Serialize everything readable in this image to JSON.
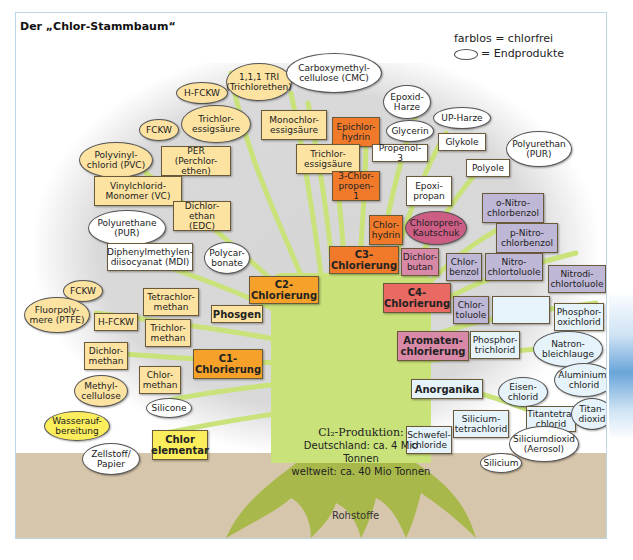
{
  "title": "Der „Chlor-Stammbaum“",
  "legend": {
    "chlorfree": "farblos = chlorfrei",
    "endproducts": "= Endprodukte"
  },
  "center": {
    "heading": "Cl₂-Produktion:",
    "germany": "Deutschland: ca. 4 Mio Tonnen",
    "world": "weltweit: ca. 40 Mio Tonnen"
  },
  "roots_label": "Rohstoffe",
  "caption": "",
  "colors": {
    "c1_c2": "#f6a22a",
    "c3": "#f07a2a",
    "c4": "#e86a63",
    "aromaten": "#d989a8",
    "anorganika": "#e6f3fb",
    "chlor_elementar": "#fbed5c",
    "chlorinated_products": "#fde3a2",
    "trunk": "#c9e27a",
    "ground": "#d6c6ab"
  },
  "nodes": {
    "hfckw_top": "H-FCKW",
    "tri": "1,1,1 TRI\n(Trichlorethen)",
    "cmc": "Carboxymethyl-\ncellulose (CMC)",
    "epoxidharze": "Epoxid-\nHarze",
    "fckw_top": "FCKW",
    "trichloressig_oval": "Trichlor-\nessigsäure",
    "monochloressig": "Monochlor-\nessigsäure",
    "epichlorhydrin": "Epichlor-\nhydrin",
    "glycerin": "Glycerin",
    "upharze": "UP-Harze",
    "pvc": "Polyvinyl-\nchlorid (PVC)",
    "per": "PER (Perchlor-\nethen)",
    "trichloressig_box": "Trichlor-\nessigsäure",
    "propenol": "Propenol-3",
    "glykole": "Glykole",
    "pur_right": "Polyurethan\n(PUR)",
    "polyole": "Polyole",
    "vc": "Vinylchlorid-\nMonomer (VC)",
    "chlorpropen": "3-Chlor-\npropen-1",
    "epoxipropan": "Epoxi-\npropan",
    "onitro": "o-Nitro-\nchlorbenzol",
    "edc": "Dichlor-\nethan (EDC)",
    "pur_left": "Polyurethane\n(PUR)",
    "chlorhydrin": "Chlor-\nhydrin",
    "chloropren": "Chloropren-\nKautschuk",
    "pnitro": "p-Nitro-\nchlorbenzol",
    "mdi": "Diphenylmethylen-\ndiisocyanat (MDI)",
    "polycarbonate": "Polycar-\nbonate",
    "c3": "C3-\nChlorierung",
    "dichlorbutan": "Dichlor-\nbutan",
    "chlorbenzol": "Chlor-\nbenzol",
    "nitrochlortoluole": "Nitro-\nchlortoluole",
    "nitrodichlortoluole": "Nitrodi-\nchlortoluole",
    "fckw_left": "FCKW",
    "c2": "C2-\nChlorierung",
    "c4": "C4-\nChlorierung",
    "tetrachlormethan": "Tetrachlor-\nmethan",
    "fluorpolymere": "Fluorpoly-\nmere (PTFE)",
    "chlortoluole": "Chlor-\ntoluole",
    "phosphorpenta": "Phosphor-\npentachlorid",
    "phosphoroxi": "Phosphor-\noxichlorid",
    "phosgen": "Phosgen",
    "hfckw_left": "H-FCKW",
    "trichlormethan": "Trichlor-\nmethan",
    "aromaten": "Aromaten-\nchlorierung",
    "phosphortri": "Phosphor-\ntrichlorid",
    "natronbleichlauge": "Natron-\nbleichlauge",
    "dichlormethan": "Dichlor-\nmethan",
    "c1": "C1-\nChlorierung",
    "aluminiumchlorid": "Aluminium-\nchlorid",
    "methylcellulose": "Methyl-\ncellulose",
    "chlormethan": "Chlor-\nmethan",
    "anorganika": "Anorganika",
    "eisenchlorid": "Eisen-\nchlorid",
    "titantetrachlorid": "Titantetra-\nchlorid",
    "titandioxid": "Titan-\ndioxid",
    "silicone": "Silicone",
    "siliciumtetrachlorid": "Silicium-\ntetrachlorid",
    "wasseraufbereitung": "Wasserauf-\nbereitung",
    "schwefelchloride": "Schwefel-\nchloride",
    "chlor_elementar": "Chlor\nelementar",
    "siliciumdioxid": "Siliciumdioxid\n(Aerosol)",
    "zellstoff": "Zellstoff/\nPapier",
    "silicium": "Silicium"
  }
}
